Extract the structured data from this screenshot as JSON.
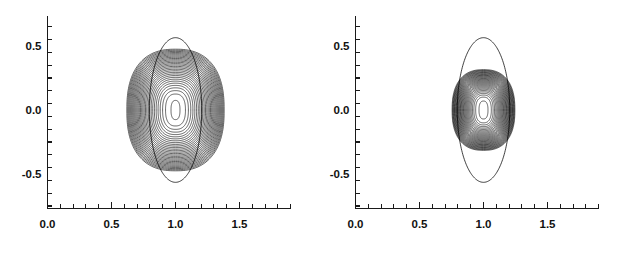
{
  "figure": {
    "title": "",
    "background_color": "#ffffff",
    "line_color": "#000000",
    "panel_count": 2
  },
  "chart_data": [
    {
      "type": "line",
      "title": "",
      "subtitle": "",
      "panel_label": "left",
      "xlabel": "",
      "ylabel": "",
      "xlim": [
        0.0,
        1.9
      ],
      "ylim": [
        -0.75,
        0.75
      ],
      "grid": false,
      "legend": null,
      "x_major_ticks": [
        0.0,
        0.5,
        1.0,
        1.5
      ],
      "x_major_tick_labels": [
        "0.0",
        "0.5",
        "1.0",
        "1.5"
      ],
      "x_minor_tick_interval": 0.1,
      "y_major_ticks": [
        -0.5,
        0.0,
        0.5
      ],
      "y_major_tick_labels": [
        "-0.5",
        "0.0",
        "0.5"
      ],
      "y_minor_tick_interval": 0.1,
      "description": "Dense family of nested closed contour levels centered near (1.0, 0.0), plus one larger smooth outer ellipse that protrudes above and below the dense bundle.",
      "center": [
        1.0,
        0.0
      ],
      "contour_levels_count": 30,
      "contours": {
        "innermost_semi_axes": [
          0.035,
          0.075
        ],
        "outermost_dense_semi_axes": [
          0.38,
          0.475
        ],
        "outer_ellipse_semi_axes": [
          0.205,
          0.565
        ],
        "shape_exponent": 2.45,
        "dense_band_side": "both"
      },
      "series": [
        {
          "name": "contour_level_01",
          "semi_x": 0.035,
          "semi_y": 0.075
        },
        {
          "name": "contour_level_02",
          "semi_x": 0.06,
          "semi_y": 0.12
        },
        {
          "name": "contour_level_03",
          "semi_x": 0.09,
          "semi_y": 0.165
        },
        {
          "name": "contour_level_04",
          "semi_x": 0.118,
          "semi_y": 0.205
        },
        {
          "name": "contour_level_05",
          "semi_x": 0.145,
          "semi_y": 0.243
        },
        {
          "name": "contour_level_06",
          "semi_x": 0.17,
          "semi_y": 0.276
        },
        {
          "name": "contour_level_07",
          "semi_x": 0.194,
          "semi_y": 0.305
        },
        {
          "name": "contour_level_08",
          "semi_x": 0.216,
          "semi_y": 0.33
        },
        {
          "name": "contour_level_09",
          "semi_x": 0.236,
          "semi_y": 0.353
        },
        {
          "name": "contour_level_10",
          "semi_x": 0.255,
          "semi_y": 0.373
        },
        {
          "name": "contour_level_11",
          "semi_x": 0.272,
          "semi_y": 0.391
        },
        {
          "name": "contour_level_12",
          "semi_x": 0.288,
          "semi_y": 0.407
        },
        {
          "name": "contour_level_13",
          "semi_x": 0.302,
          "semi_y": 0.421
        },
        {
          "name": "contour_level_14",
          "semi_x": 0.315,
          "semi_y": 0.433
        },
        {
          "name": "contour_level_15",
          "semi_x": 0.327,
          "semi_y": 0.443
        },
        {
          "name": "contour_level_16",
          "semi_x": 0.337,
          "semi_y": 0.452
        },
        {
          "name": "contour_level_17",
          "semi_x": 0.346,
          "semi_y": 0.459
        },
        {
          "name": "contour_level_18",
          "semi_x": 0.354,
          "semi_y": 0.464
        },
        {
          "name": "contour_level_19",
          "semi_x": 0.361,
          "semi_y": 0.468
        },
        {
          "name": "contour_level_20",
          "semi_x": 0.367,
          "semi_y": 0.471
        },
        {
          "name": "contour_level_21",
          "semi_x": 0.372,
          "semi_y": 0.473
        },
        {
          "name": "contour_level_22",
          "semi_x": 0.376,
          "semi_y": 0.474
        },
        {
          "name": "contour_level_23",
          "semi_x": 0.379,
          "semi_y": 0.475
        },
        {
          "name": "contour_outer_ellipse",
          "semi_x": 0.205,
          "semi_y": 0.565
        }
      ]
    },
    {
      "type": "line",
      "title": "",
      "subtitle": "",
      "panel_label": "right",
      "xlabel": "",
      "ylabel": "",
      "xlim": [
        0.0,
        1.9
      ],
      "ylim": [
        -0.75,
        0.75
      ],
      "grid": false,
      "legend": null,
      "x_major_ticks": [
        0.0,
        0.5,
        1.0,
        1.5
      ],
      "x_major_tick_labels": [
        "0.0",
        "0.5",
        "1.0",
        "1.5"
      ],
      "x_minor_tick_interval": 0.1,
      "y_major_ticks": [
        -0.5,
        0.0,
        0.5
      ],
      "y_major_tick_labels": [
        "-0.5",
        "0.0",
        "0.5"
      ],
      "y_minor_tick_interval": 0.1,
      "description": "Narrower nested contour family centered near (1.0, 0.0) with a thick dark band of closely packed levels, plus one large smooth outer ellipse extending well beyond the dense bundle vertically.",
      "center": [
        1.0,
        0.0
      ],
      "contour_levels_count": 30,
      "contours": {
        "innermost_semi_axes": [
          0.035,
          0.07
        ],
        "outermost_dense_semi_axes": [
          0.245,
          0.315
        ],
        "outer_ellipse_semi_axes": [
          0.205,
          0.565
        ],
        "shape_exponent": 2.45,
        "dense_band_side": "both"
      },
      "series": [
        {
          "name": "contour_level_01",
          "semi_x": 0.035,
          "semi_y": 0.07
        },
        {
          "name": "contour_level_02",
          "semi_x": 0.058,
          "semi_y": 0.108
        },
        {
          "name": "contour_level_03",
          "semi_x": 0.08,
          "semi_y": 0.142
        },
        {
          "name": "contour_level_04",
          "semi_x": 0.1,
          "semi_y": 0.172
        },
        {
          "name": "contour_level_05",
          "semi_x": 0.119,
          "semi_y": 0.198
        },
        {
          "name": "contour_level_06",
          "semi_x": 0.136,
          "semi_y": 0.221
        },
        {
          "name": "contour_level_07",
          "semi_x": 0.152,
          "semi_y": 0.241
        },
        {
          "name": "contour_level_08",
          "semi_x": 0.166,
          "semi_y": 0.258
        },
        {
          "name": "contour_level_09",
          "semi_x": 0.179,
          "semi_y": 0.272
        },
        {
          "name": "contour_level_10",
          "semi_x": 0.191,
          "semi_y": 0.284
        },
        {
          "name": "contour_level_11",
          "semi_x": 0.201,
          "semi_y": 0.294
        },
        {
          "name": "contour_level_12",
          "semi_x": 0.21,
          "semi_y": 0.301
        },
        {
          "name": "contour_level_13",
          "semi_x": 0.218,
          "semi_y": 0.306
        },
        {
          "name": "contour_level_14",
          "semi_x": 0.225,
          "semi_y": 0.31
        },
        {
          "name": "contour_level_15",
          "semi_x": 0.231,
          "semi_y": 0.312
        },
        {
          "name": "contour_level_16",
          "semi_x": 0.236,
          "semi_y": 0.314
        },
        {
          "name": "contour_level_17",
          "semi_x": 0.24,
          "semi_y": 0.315
        },
        {
          "name": "contour_level_18",
          "semi_x": 0.243,
          "semi_y": 0.315
        },
        {
          "name": "contour_level_19",
          "semi_x": 0.245,
          "semi_y": 0.315
        },
        {
          "name": "contour_outer_ellipse",
          "semi_x": 0.205,
          "semi_y": 0.565
        }
      ]
    }
  ]
}
